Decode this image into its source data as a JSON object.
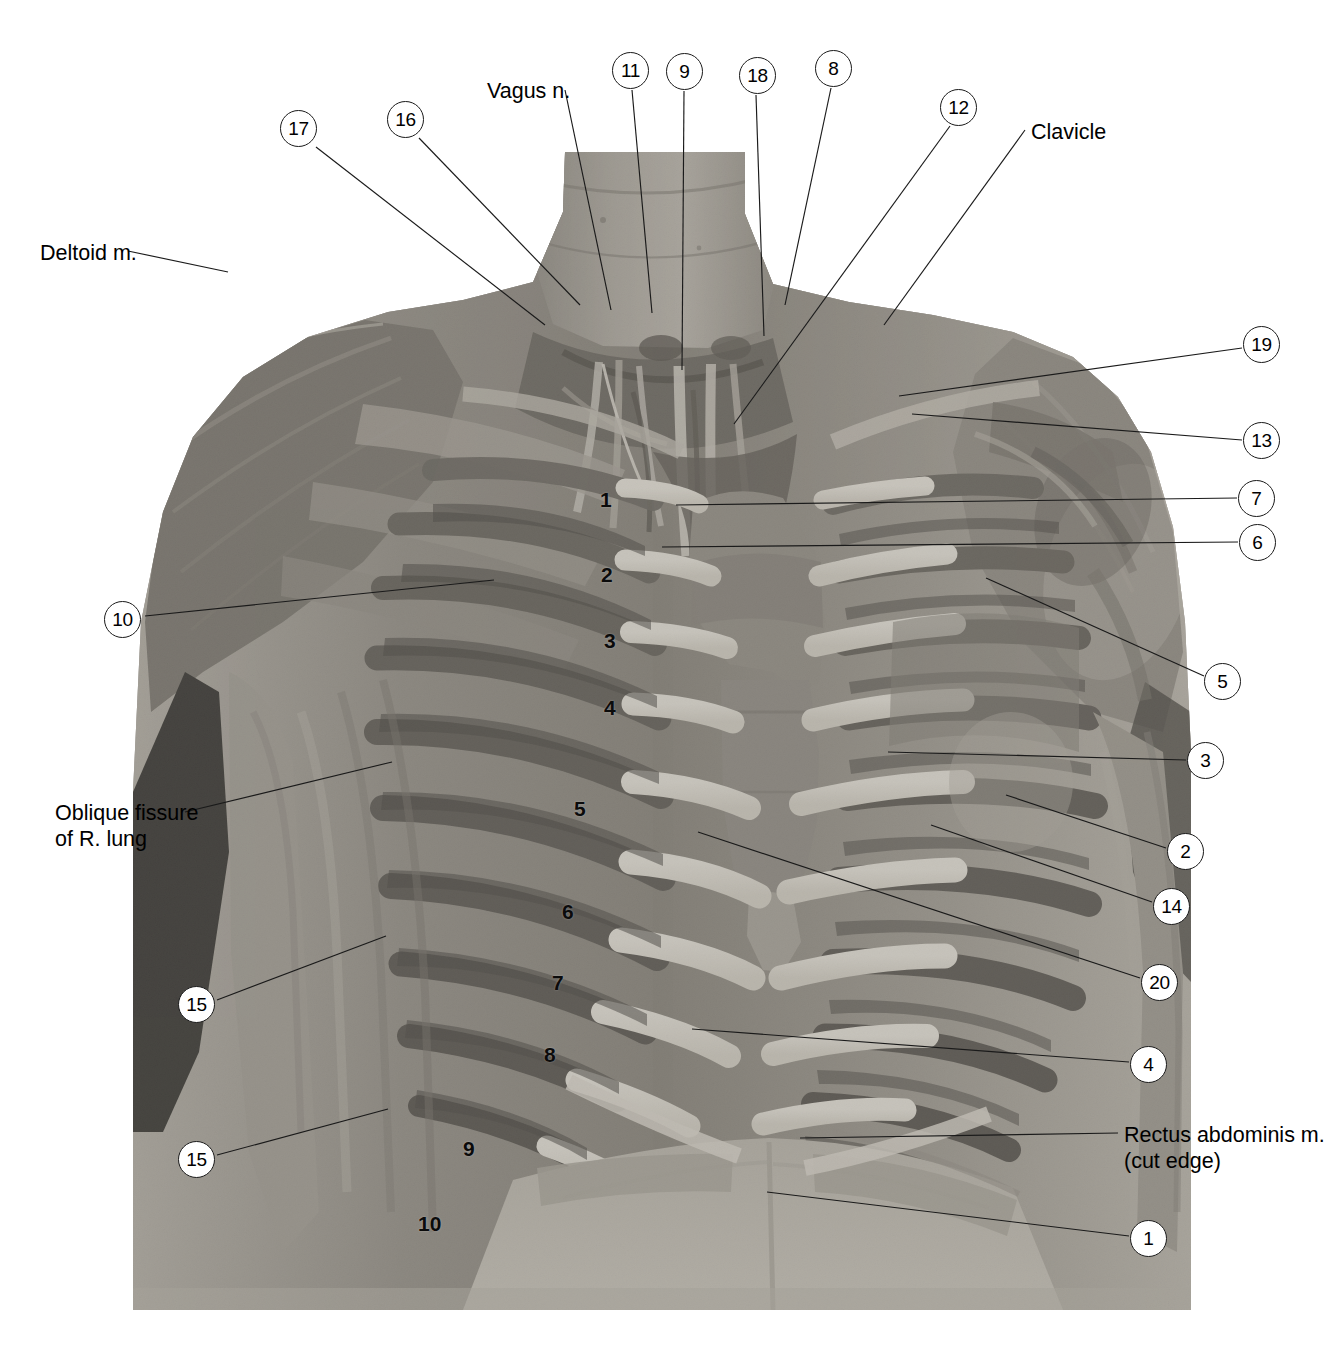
{
  "figure": {
    "kind": "anatomical-photograph",
    "plate_bounds": {
      "x": 133,
      "y": 152,
      "w": 1058,
      "h": 1158
    }
  },
  "text_labels": [
    {
      "id": "deltoid",
      "lines": [
        "Deltoid m."
      ],
      "x": 40,
      "y": 240,
      "align": "left"
    },
    {
      "id": "vagus",
      "lines": [
        "Vagus n."
      ],
      "x": 487,
      "y": 78,
      "align": "left"
    },
    {
      "id": "clavicle",
      "lines": [
        "Clavicle"
      ],
      "x": 1031,
      "y": 119,
      "align": "left"
    },
    {
      "id": "oblique-fissure",
      "lines": [
        "Oblique fissure",
        "of R. lung"
      ],
      "x": 55,
      "y": 800,
      "align": "left"
    },
    {
      "id": "rectus-abdominis",
      "lines": [
        "Rectus abdominis m.",
        "(cut edge)"
      ],
      "x": 1124,
      "y": 1122,
      "align": "left"
    }
  ],
  "markers": [
    {
      "num": "17",
      "x": 298,
      "y": 128
    },
    {
      "num": "16",
      "x": 405,
      "y": 119
    },
    {
      "num": "11",
      "x": 630,
      "y": 70
    },
    {
      "num": "9",
      "x": 684,
      "y": 71
    },
    {
      "num": "18",
      "x": 757,
      "y": 75
    },
    {
      "num": "8",
      "x": 833,
      "y": 68
    },
    {
      "num": "12",
      "x": 958,
      "y": 107
    },
    {
      "num": "19",
      "x": 1261,
      "y": 344
    },
    {
      "num": "13",
      "x": 1261,
      "y": 440
    },
    {
      "num": "7",
      "x": 1256,
      "y": 498
    },
    {
      "num": "6",
      "x": 1257,
      "y": 542
    },
    {
      "num": "5",
      "x": 1222,
      "y": 681
    },
    {
      "num": "3",
      "x": 1205,
      "y": 760
    },
    {
      "num": "2",
      "x": 1185,
      "y": 851
    },
    {
      "num": "14",
      "x": 1171,
      "y": 906
    },
    {
      "num": "20",
      "x": 1159,
      "y": 982
    },
    {
      "num": "4",
      "x": 1148,
      "y": 1064
    },
    {
      "num": "1",
      "x": 1148,
      "y": 1238
    },
    {
      "num": "10",
      "x": 122,
      "y": 619
    },
    {
      "num": "15",
      "x": 196,
      "y": 1004
    },
    {
      "num": "15",
      "x": 196,
      "y": 1159
    }
  ],
  "leader_lines": [
    {
      "for": "deltoid",
      "x1": 128,
      "y1": 251,
      "x2": 228,
      "y2": 272
    },
    {
      "for": "vagus",
      "x1": 565,
      "y1": 90,
      "x2": 611,
      "y2": 310
    },
    {
      "for": "clavicle",
      "x1": 1025,
      "y1": 130,
      "x2": 884,
      "y2": 325
    },
    {
      "for": "oblique-fissure",
      "x1": 185,
      "y1": 812,
      "x2": 392,
      "y2": 762
    },
    {
      "for": "rectus-abdominis",
      "x1": 1118,
      "y1": 1133,
      "x2": 800,
      "y2": 1138
    },
    {
      "for": "17",
      "x1": 316,
      "y1": 147,
      "x2": 545,
      "y2": 325
    },
    {
      "for": "16",
      "x1": 419,
      "y1": 138,
      "x2": 580,
      "y2": 305
    },
    {
      "for": "11",
      "x1": 632,
      "y1": 90,
      "x2": 652,
      "y2": 313
    },
    {
      "for": "9",
      "x1": 684,
      "y1": 91,
      "x2": 682,
      "y2": 370
    },
    {
      "for": "18",
      "x1": 756,
      "y1": 95,
      "x2": 764,
      "y2": 336
    },
    {
      "for": "8",
      "x1": 831,
      "y1": 88,
      "x2": 785,
      "y2": 305
    },
    {
      "for": "12",
      "x1": 950,
      "y1": 126,
      "x2": 734,
      "y2": 424
    },
    {
      "for": "19",
      "x1": 1242,
      "y1": 348,
      "x2": 899,
      "y2": 396
    },
    {
      "for": "13",
      "x1": 1242,
      "y1": 440,
      "x2": 912,
      "y2": 414
    },
    {
      "for": "7",
      "x1": 1237,
      "y1": 498,
      "x2": 676,
      "y2": 505
    },
    {
      "for": "6",
      "x1": 1238,
      "y1": 542,
      "x2": 662,
      "y2": 547
    },
    {
      "for": "5",
      "x1": 1204,
      "y1": 676,
      "x2": 986,
      "y2": 578
    },
    {
      "for": "3",
      "x1": 1186,
      "y1": 760,
      "x2": 888,
      "y2": 752
    },
    {
      "for": "2",
      "x1": 1166,
      "y1": 848,
      "x2": 1006,
      "y2": 795
    },
    {
      "for": "14",
      "x1": 1152,
      "y1": 902,
      "x2": 931,
      "y2": 825
    },
    {
      "for": "20",
      "x1": 1140,
      "y1": 978,
      "x2": 698,
      "y2": 832
    },
    {
      "for": "4",
      "x1": 1129,
      "y1": 1062,
      "x2": 692,
      "y2": 1029
    },
    {
      "for": "1",
      "x1": 1129,
      "y1": 1236,
      "x2": 767,
      "y2": 1192
    },
    {
      "for": "10",
      "x1": 145,
      "y1": 616,
      "x2": 494,
      "y2": 580
    },
    {
      "for": "15a",
      "x1": 217,
      "y1": 1000,
      "x2": 386,
      "y2": 936
    },
    {
      "for": "15b",
      "x1": 217,
      "y1": 1155,
      "x2": 388,
      "y2": 1109
    }
  ],
  "rib_numerals": [
    {
      "label": "1",
      "x": 600,
      "y": 488
    },
    {
      "label": "2",
      "x": 601,
      "y": 563
    },
    {
      "label": "3",
      "x": 604,
      "y": 629
    },
    {
      "label": "4",
      "x": 604,
      "y": 696
    },
    {
      "label": "5",
      "x": 574,
      "y": 797
    },
    {
      "label": "6",
      "x": 562,
      "y": 900
    },
    {
      "label": "7",
      "x": 552,
      "y": 971
    },
    {
      "label": "8",
      "x": 544,
      "y": 1043
    },
    {
      "label": "9",
      "x": 463,
      "y": 1137
    },
    {
      "label": "10",
      "x": 418,
      "y": 1212
    }
  ],
  "colors": {
    "line": "#1a1a1a",
    "text": "#000000",
    "background": "#ffffff",
    "photo_mid": "#8d8d8d",
    "photo_dark": "#3a3a3a",
    "photo_light": "#d8d6d0",
    "bone": "#efece4"
  }
}
